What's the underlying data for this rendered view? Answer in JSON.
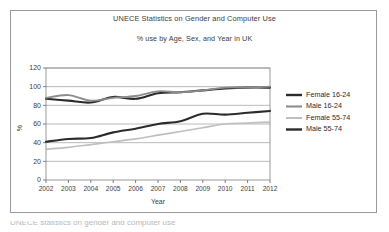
{
  "figure": {
    "caption_partial": "UNECE statistics on gender and computer use"
  },
  "chart_data": {
    "type": "line",
    "title": "UNECE Statistics on Gender and Computer Use",
    "subtitle": "% use by Age, Sex, and Year in UK",
    "xlabel": "Year",
    "ylabel": "%",
    "grid": true,
    "legend_position": "right",
    "x": [
      2002,
      2003,
      2004,
      2005,
      2006,
      2007,
      2008,
      2009,
      2010,
      2011,
      2012
    ],
    "categories": [
      "2002",
      "2003",
      "2004",
      "2005",
      "2006",
      "2007",
      "2008",
      "2009",
      "2010",
      "2011",
      "2012"
    ],
    "xlim": [
      2002,
      2012
    ],
    "ylim": [
      0,
      120
    ],
    "yticks": [
      0,
      20,
      40,
      60,
      80,
      100,
      120
    ],
    "series": [
      {
        "name": "Female 16-24",
        "color": "#2b2b2b",
        "width": 2.1,
        "values": [
          87,
          85,
          83,
          89,
          87,
          93,
          94,
          96,
          98,
          99,
          99
        ]
      },
      {
        "name": "Male 16-24",
        "color": "#8c8c8c",
        "width": 1.8,
        "values": [
          88,
          91,
          85,
          88,
          90,
          95,
          94,
          96,
          99,
          99,
          100
        ]
      },
      {
        "name": "Female 55-74",
        "color": "#bfbfbf",
        "width": 1.7,
        "values": [
          33,
          35,
          38,
          41,
          44,
          48,
          52,
          56,
          60,
          61,
          62
        ]
      },
      {
        "name": "Male 55-74",
        "color": "#2b2b2b",
        "width": 2.1,
        "values": [
          41,
          44,
          45,
          51,
          55,
          60,
          63,
          71,
          70,
          72,
          74
        ]
      }
    ]
  }
}
